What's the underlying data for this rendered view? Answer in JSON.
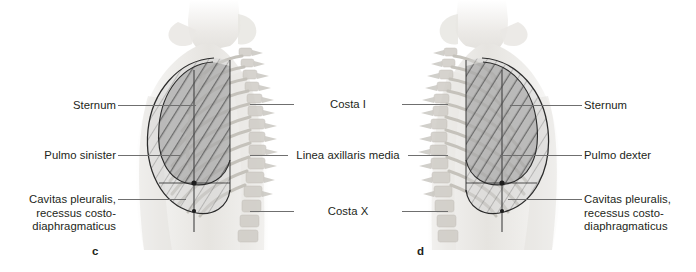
{
  "figure": {
    "caption_letters": [
      {
        "name": "panel-c",
        "text": "c",
        "x": 92,
        "y": 245
      },
      {
        "name": "panel-d",
        "text": "d",
        "x": 417,
        "y": 245
      }
    ]
  },
  "labels_left": [
    {
      "id": "sternum-left",
      "text": "Sternum",
      "x": 12,
      "y": 99,
      "width": 104,
      "leader": {
        "x": 118,
        "y": 105,
        "width": 78
      }
    },
    {
      "id": "pulmo-sinister",
      "text": "Pulmo sinister",
      "x": 12,
      "y": 149,
      "width": 104,
      "leader": {
        "x": 118,
        "y": 155,
        "width": 62
      }
    },
    {
      "id": "cavitas-pleuralis-left",
      "lines": [
        "Cavitas pleuralis,",
        "recessus costo-",
        "diaphragmaticus"
      ],
      "x": 10,
      "y": 193,
      "width": 106,
      "leader": {
        "x": 118,
        "y": 199,
        "width": 68
      }
    }
  ],
  "labels_center": [
    {
      "id": "costa-i",
      "text": "Costa I",
      "x": 296,
      "y": 98,
      "width": 104,
      "leader_left": {
        "x": 250,
        "y": 104,
        "width": 44
      },
      "leader_right": {
        "x": 402,
        "y": 104,
        "width": 46
      }
    },
    {
      "id": "linea-axillaris-media",
      "text": "Linea axillaris media",
      "x": 290,
      "y": 149,
      "width": 116,
      "leader_left": {
        "x": 250,
        "y": 155,
        "width": 38
      },
      "leader_right": {
        "x": 408,
        "y": 155,
        "width": 40
      }
    },
    {
      "id": "costa-x",
      "text": "Costa X",
      "x": 296,
      "y": 205,
      "width": 104,
      "leader_left": {
        "x": 250,
        "y": 211,
        "width": 44
      },
      "leader_right": {
        "x": 402,
        "y": 211,
        "width": 46
      }
    }
  ],
  "labels_right": [
    {
      "id": "sternum-right",
      "text": "Sternum",
      "x": 584,
      "y": 99,
      "width": 110,
      "leader": {
        "x": 510,
        "y": 105,
        "width": 72
      }
    },
    {
      "id": "pulmo-dexter",
      "text": "Pulmo dexter",
      "x": 584,
      "y": 149,
      "width": 110,
      "leader": {
        "x": 500,
        "y": 155,
        "width": 82
      }
    },
    {
      "id": "cavitas-pleuralis-right",
      "lines": [
        "Cavitas pleuralis,",
        "recessus costo-",
        "diaphragmaticus"
      ],
      "x": 584,
      "y": 193,
      "width": 112,
      "leader": {
        "x": 508,
        "y": 199,
        "width": 74
      }
    }
  ],
  "colors": {
    "text": "#231f20",
    "leader_line": "#6f6f6f",
    "outline": "#2b2b2b",
    "axis_line": "#4a4a4a",
    "lung_fill": "#8e8e8e",
    "recess_fill": "#c9c9c9",
    "body_light": "#efeeec",
    "bone": "#d8d6d2"
  },
  "graphic": {
    "view_label": "lateral-thorax-projection",
    "description_c": "left lateral thorax with pleural cavity and lung projection",
    "description_d": "right lateral thorax with pleural cavity and lung projection"
  }
}
